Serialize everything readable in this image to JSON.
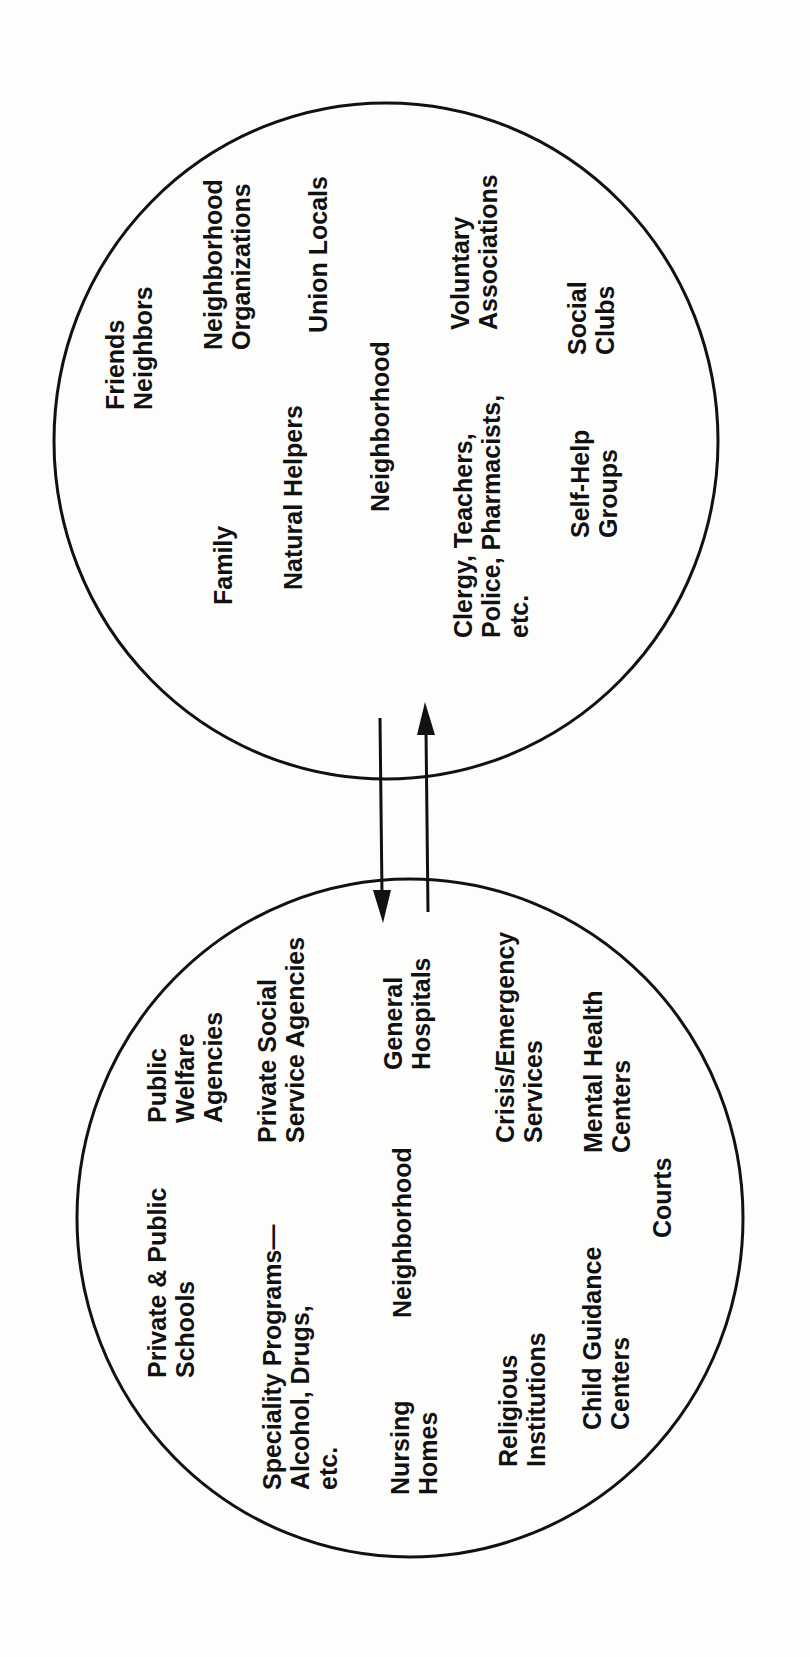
{
  "diagram": {
    "type": "two-circle network diagram",
    "orientation": "rotated 90 degrees counter-clockwise",
    "colors": {
      "background": "#fdfdfc",
      "ink": "#111111"
    },
    "informal_circle": {
      "name": "Neighborhood (informal helping network)",
      "center_label": "Neighborhood",
      "labels": [
        {
          "lines": [
            "Friends",
            "Neighbors"
          ]
        },
        {
          "lines": [
            "Neighborhood",
            "Organizations"
          ]
        },
        {
          "lines": [
            "Union Locals"
          ]
        },
        {
          "lines": [
            "Family"
          ]
        },
        {
          "lines": [
            "Natural Helpers"
          ]
        },
        {
          "lines": [
            "Neighborhood"
          ]
        },
        {
          "lines": [
            "Voluntary",
            "Associations"
          ]
        },
        {
          "lines": [
            "Clergy, Teachers,",
            "Police, Pharmacists,",
            "etc."
          ]
        },
        {
          "lines": [
            "Social",
            "Clubs"
          ]
        },
        {
          "lines": [
            "Self-Help",
            "Groups"
          ]
        }
      ]
    },
    "formal_circle": {
      "name": "Neighborhood (formal service network)",
      "center_label": "Neighborhood",
      "labels": [
        {
          "lines": [
            "Public",
            "Welfare",
            "Agencies"
          ]
        },
        {
          "lines": [
            "Private & Public",
            "Schools"
          ]
        },
        {
          "lines": [
            "Private Social",
            "Service Agencies"
          ]
        },
        {
          "lines": [
            "Speciality Programs—",
            "Alcohol, Drugs,",
            "etc."
          ]
        },
        {
          "lines": [
            "General",
            "Hospitals"
          ]
        },
        {
          "lines": [
            "Neighborhood"
          ]
        },
        {
          "lines": [
            "Nursing",
            "Homes"
          ]
        },
        {
          "lines": [
            "Crisis/Emergency",
            "Services"
          ]
        },
        {
          "lines": [
            "Religious",
            "Institutions"
          ]
        },
        {
          "lines": [
            "Mental Health",
            "Centers"
          ]
        },
        {
          "lines": [
            "Child Guidance",
            "Centers"
          ]
        },
        {
          "lines": [
            "Courts"
          ]
        }
      ]
    },
    "connectors": [
      {
        "direction": "informal-to-formal",
        "arrow": "down"
      },
      {
        "direction": "formal-to-informal",
        "arrow": "up"
      }
    ]
  }
}
